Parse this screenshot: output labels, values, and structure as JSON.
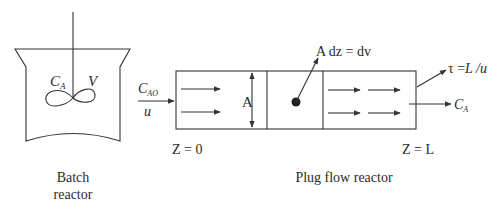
{
  "diagram": {
    "batch_reactor": {
      "concentration_label": "C",
      "concentration_sub": "A",
      "volume_label": "V",
      "caption_line1": "Batch",
      "caption_line2": "reactor"
    },
    "plug_flow_reactor": {
      "inlet_conc": "C",
      "inlet_conc_sub": "AO",
      "inlet_velocity": "u",
      "area_label": "A",
      "element_label": "A dz = dv",
      "residence_time_label": "τ =",
      "residence_time_expr": "L /u",
      "outlet_conc": "C",
      "outlet_conc_sub": "A",
      "start_label": "Z = 0",
      "end_label": "Z = L",
      "caption": "Plug flow reactor"
    }
  }
}
